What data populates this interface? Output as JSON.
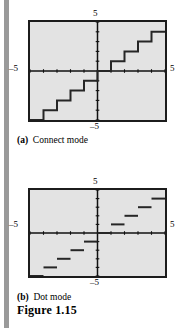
{
  "figure": {
    "title": "Figure 1.15",
    "panels": [
      {
        "id": "panel-a",
        "tag": "(a)",
        "caption": "Connect mode",
        "axis_labels": {
          "top": "5",
          "left": "–5",
          "right": "5",
          "bottom": "–5"
        }
      },
      {
        "id": "panel-b",
        "tag": "(b)",
        "caption": "Dot mode",
        "axis_labels": {
          "top": "5",
          "left": "–5",
          "right": "5",
          "bottom": "–5"
        }
      }
    ]
  },
  "colors": {
    "screen_fill": "#e3e3e3",
    "screen_border": "#1c1c1c",
    "curve": "#262626",
    "axis": "#111111",
    "gutter": "#9a9a9a"
  },
  "chart_data": [
    {
      "type": "line",
      "title": "Connect mode",
      "subtitle": "(a)",
      "function": "y = int(x)  (greatest integer / floor function)",
      "xlabel": "",
      "ylabel": "",
      "xlim": [
        -5,
        5
      ],
      "ylim": [
        -5,
        5
      ],
      "grid": false,
      "legend": null,
      "axis_tick_labels": {
        "xmin": "-5",
        "xmax": "5",
        "ymin": "-5",
        "ymax": "5"
      },
      "tick_spacing": 1,
      "render_style": "connected vertical risers between steps",
      "steps": [
        {
          "x_start": -5,
          "x_end": -4,
          "y": -5
        },
        {
          "x_start": -4,
          "x_end": -3,
          "y": -4
        },
        {
          "x_start": -3,
          "x_end": -2,
          "y": -3
        },
        {
          "x_start": -2,
          "x_end": -1,
          "y": -2
        },
        {
          "x_start": -1,
          "x_end": 0,
          "y": -1
        },
        {
          "x_start": 0,
          "x_end": 1,
          "y": 0
        },
        {
          "x_start": 1,
          "x_end": 2,
          "y": 1
        },
        {
          "x_start": 2,
          "x_end": 3,
          "y": 2
        },
        {
          "x_start": 3,
          "x_end": 4,
          "y": 3
        },
        {
          "x_start": 4,
          "x_end": 5,
          "y": 4
        }
      ]
    },
    {
      "type": "line",
      "title": "Dot mode",
      "subtitle": "(b)",
      "function": "y = int(x)  (greatest integer / floor function)",
      "xlabel": "",
      "ylabel": "",
      "xlim": [
        -5,
        5
      ],
      "ylim": [
        -5,
        5
      ],
      "grid": false,
      "legend": null,
      "axis_tick_labels": {
        "xmin": "-5",
        "xmax": "5",
        "ymin": "-5",
        "ymax": "5"
      },
      "tick_spacing": 1,
      "render_style": "separate horizontal segments, no vertical risers",
      "steps": [
        {
          "x_start": -5,
          "x_end": -4,
          "y": -5
        },
        {
          "x_start": -4,
          "x_end": -3,
          "y": -4
        },
        {
          "x_start": -3,
          "x_end": -2,
          "y": -3
        },
        {
          "x_start": -2,
          "x_end": -1,
          "y": -2
        },
        {
          "x_start": -1,
          "x_end": 0,
          "y": -1
        },
        {
          "x_start": 0,
          "x_end": 1,
          "y": 0
        },
        {
          "x_start": 1,
          "x_end": 2,
          "y": 1
        },
        {
          "x_start": 2,
          "x_end": 3,
          "y": 2
        },
        {
          "x_start": 3,
          "x_end": 4,
          "y": 3
        },
        {
          "x_start": 4,
          "x_end": 5,
          "y": 4
        }
      ]
    }
  ]
}
